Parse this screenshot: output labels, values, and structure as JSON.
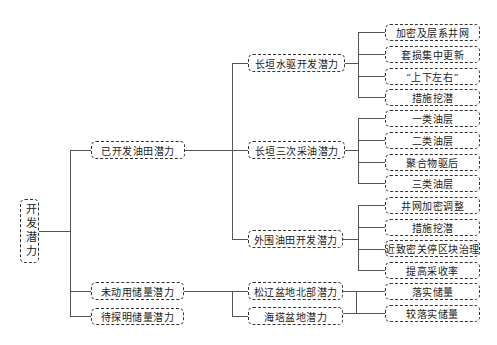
{
  "root": {
    "label": "开发潜力"
  },
  "level1": [
    {
      "label": "已开发油田潜力"
    },
    {
      "label": "未动用储量潜力"
    },
    {
      "label": "待探明储量潜力"
    }
  ],
  "level2": [
    {
      "label": "长垣水驱开发潜力",
      "parent": "已开发油田潜力"
    },
    {
      "label": "长垣三次采油潜力",
      "parent": "已开发油田潜力"
    },
    {
      "label": "外围油田开发潜力",
      "parent": "已开发油田潜力"
    },
    {
      "label": "松辽盆地北部潜力",
      "parent": "未动用储量潜力"
    },
    {
      "label": "海塔盆地潜力",
      "parent": "未动用储量潜力"
    }
  ],
  "level3": [
    {
      "label": "加密及层系井网",
      "parent": "长垣水驱开发潜力"
    },
    {
      "label": "套损集中更新",
      "parent": "长垣水驱开发潜力"
    },
    {
      "label": "“上下左右”",
      "parent": "长垣水驱开发潜力"
    },
    {
      "label": "措施挖潜",
      "parent": "长垣水驱开发潜力"
    },
    {
      "label": "一类油层",
      "parent": "长垣三次采油潜力"
    },
    {
      "label": "二类油层",
      "parent": "长垣三次采油潜力"
    },
    {
      "label": "聚合物驱后",
      "parent": "长垣三次采油潜力"
    },
    {
      "label": "三类油层",
      "parent": "长垣三次采油潜力"
    },
    {
      "label": "井网加密调整",
      "parent": "外围油田开发潜力"
    },
    {
      "label": "措施挖潜",
      "parent": "外围油田开发潜力"
    },
    {
      "label": "近致密关停区块治理",
      "parent": "外围油田开发潜力"
    },
    {
      "label": "提高采收率",
      "parent": "外围油田开发潜力"
    },
    {
      "label": "落实储量",
      "parent": "松辽盆地北部潜力 / 海塔盆地潜力"
    },
    {
      "label": "较落实储量",
      "parent": "松辽盆地北部潜力 / 海塔盆地潜力"
    }
  ]
}
